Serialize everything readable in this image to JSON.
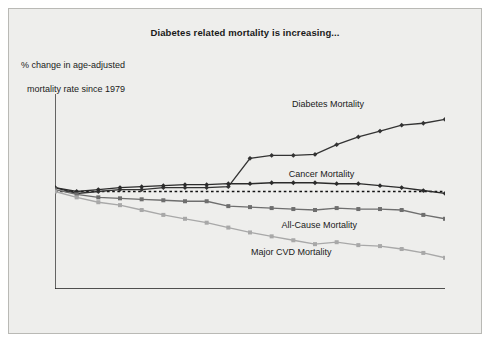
{
  "figure": {
    "title": "Diabetes related mortality is increasing...",
    "ylabel_line1": "% change in age-adjusted",
    "ylabel_line2": "mortality rate since 1979",
    "background": "#eeeeec",
    "border_color": "#b9b9b5"
  },
  "chart_data": {
    "type": "line",
    "title": "Diabetes related mortality is increasing...",
    "xlabel": "",
    "ylabel": "% change in age-adjusted mortality rate since 1979",
    "grid": false,
    "legend_position": "inline-annotations",
    "zero_reference_line": 0,
    "xlim": [
      1980,
      1998
    ],
    "ylim": [
      -50,
      50
    ],
    "ytick_values": [
      50,
      40,
      30,
      20,
      10,
      0,
      -10,
      -20,
      -30,
      -40,
      -50
    ],
    "ytick_labels": [
      "50",
      "40",
      "30",
      "20",
      "10",
      "0",
      "–10",
      "–20",
      "–30",
      "–40",
      "–50"
    ],
    "categories": [
      1980,
      1981,
      1982,
      1983,
      1984,
      1985,
      1986,
      1987,
      1988,
      1989,
      1990,
      1991,
      1992,
      1993,
      1994,
      1995,
      1996,
      1997,
      1998
    ],
    "xtick_labels": [
      "1980",
      "1981",
      "1982",
      "1983",
      "1984",
      "1985",
      "1986",
      "1987",
      "1988",
      "1989",
      "1990",
      "1991",
      "1992",
      "1993",
      "1994",
      "1995",
      "1996",
      "1997",
      "1998"
    ],
    "series": [
      {
        "name": "Diabetes Mortality",
        "color": "#333333",
        "marker": "diamond",
        "label_x": 1992.6,
        "label_y": 45,
        "values": [
          2,
          -1,
          0,
          1,
          1,
          2,
          2,
          2,
          2.5,
          17,
          18.5,
          18.5,
          19,
          24,
          28,
          31,
          34,
          35,
          37
        ]
      },
      {
        "name": "Cancer Mortality",
        "color": "#2b2b2b",
        "marker": "diamond",
        "label_x": 1992.3,
        "label_y": 9,
        "values": [
          2,
          0,
          1,
          2,
          2.5,
          3,
          3.5,
          3.5,
          4,
          4,
          4.5,
          4.5,
          4.5,
          4,
          4,
          3,
          2,
          0.5,
          -1
        ]
      },
      {
        "name": "All-Cause Mortality",
        "color": "#6e6e6e",
        "marker": "square",
        "label_x": 1992.2,
        "label_y": -17,
        "values": [
          1,
          -1.5,
          -3,
          -3.5,
          -4,
          -4.5,
          -5,
          -5,
          -7.5,
          -8,
          -8.5,
          -9,
          -9.5,
          -8.5,
          -9,
          -9,
          -9.5,
          -12,
          -14
        ]
      },
      {
        "name": "Major CVD Mortality",
        "color": "#a8a8a8",
        "marker": "square",
        "label_x": 1990.9,
        "label_y": -31,
        "values": [
          0,
          -3,
          -5.5,
          -7,
          -9.5,
          -12,
          -14,
          -16,
          -18.5,
          -21,
          -23,
          -25,
          -27,
          -26,
          -27.5,
          -28,
          -29.5,
          -31.5,
          -34
        ]
      }
    ]
  }
}
